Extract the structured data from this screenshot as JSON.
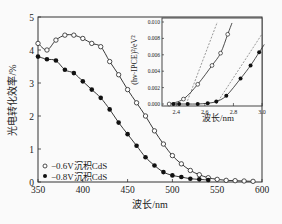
{
  "chart_data": [
    {
      "type": "line",
      "title": "",
      "xlabel": "波长/nm",
      "ylabel": "光电转化效率/%",
      "xlim": [
        350,
        600
      ],
      "ylim": [
        0,
        5
      ],
      "xticks": [
        350,
        400,
        450,
        500,
        550,
        600
      ],
      "yticks": [
        0,
        1,
        2,
        3,
        4,
        5
      ],
      "grid": false,
      "legend_position": "lower-left",
      "series": [
        {
          "name": "−0.6V沉积CdS",
          "marker": "open-circle",
          "x": [
            350,
            360,
            370,
            380,
            390,
            400,
            410,
            420,
            430,
            440,
            450,
            460,
            470,
            480,
            490,
            500,
            510,
            520,
            530,
            540,
            550,
            560,
            570,
            580,
            590
          ],
          "y": [
            4.2,
            4.0,
            4.3,
            4.45,
            4.45,
            4.35,
            4.2,
            4.1,
            3.65,
            3.25,
            2.8,
            2.4,
            2.0,
            1.55,
            1.15,
            0.8,
            0.55,
            0.35,
            0.22,
            0.13,
            0.08,
            0.05,
            0.04,
            0.03,
            0.02
          ]
        },
        {
          "name": "−0.8V沉积CdS",
          "marker": "filled-circle",
          "x": [
            350,
            360,
            370,
            380,
            390,
            400,
            410,
            420,
            430,
            440,
            450,
            460,
            470,
            480,
            490,
            500,
            510,
            520,
            530,
            540
          ],
          "y": [
            3.8,
            3.72,
            3.68,
            3.4,
            3.3,
            3.05,
            2.8,
            2.55,
            2.2,
            1.8,
            1.45,
            1.1,
            0.75,
            0.5,
            0.3,
            0.2,
            0.15,
            0.1,
            0.08,
            0.06
          ]
        }
      ]
    },
    {
      "type": "line",
      "title": "inset",
      "xlabel": "波长/nm",
      "ylabel": "(hν·IPCE)²/eV²",
      "xlim": [
        2.3,
        3.0
      ],
      "ylim": [
        0,
        0.01
      ],
      "xticks": [
        2.4,
        2.6,
        2.8,
        3.0
      ],
      "yticks": [
        0.0,
        0.002,
        0.004,
        0.006,
        0.008,
        0.01
      ],
      "series": [
        {
          "name": "−0.6V沉积CdS",
          "marker": "open-circle",
          "x": [
            2.35,
            2.45,
            2.55,
            2.65,
            2.71,
            2.76
          ],
          "y": [
            0.0,
            0.0006,
            0.0024,
            0.0047,
            0.0062,
            0.0085
          ],
          "tangent_intercept_x": 2.47
        },
        {
          "name": "−0.8V沉积CdS",
          "marker": "filled-circle",
          "x": [
            2.38,
            2.42,
            2.48,
            2.55,
            2.62,
            2.68,
            2.75,
            2.85,
            2.92,
            2.98
          ],
          "y": [
            0.0,
            0.0,
            0.0,
            0.0,
            0.0001,
            0.0003,
            0.001,
            0.0031,
            0.0047,
            0.0063
          ],
          "tangent_intercept_x": 2.68
        }
      ]
    }
  ],
  "labels": {
    "main_xlabel": "波长/nm",
    "main_ylabel": "光电转化效率/%",
    "inset_xlabel": "波长/nm",
    "inset_ylabel": "(hν·IPCE)²/eV²",
    "legend_open": "−0.6V沉积CdS",
    "legend_filled": "−0.8V沉积CdS"
  }
}
